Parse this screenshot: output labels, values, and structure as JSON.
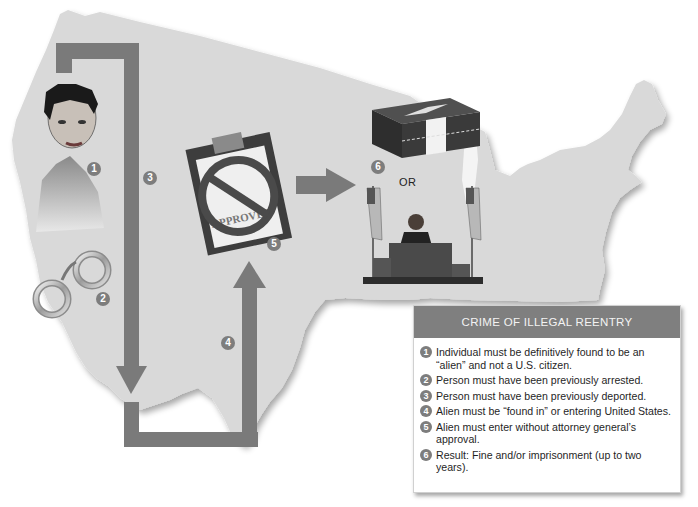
{
  "diagram": {
    "title": "CRIME OF ILLEGAL REENTRY",
    "or_label": "OR",
    "stamp_text": "APPROVED",
    "colors": {
      "map_fill": "#d9d9d9",
      "arrow": "#7a7a7a",
      "marker": "#7d7d7d",
      "legend_header": "#7f7f7f",
      "legend_header_text": "#f3f3f3"
    },
    "markers": [
      {
        "number": "1",
        "label": "person"
      },
      {
        "number": "2",
        "label": "handcuffs"
      },
      {
        "number": "3",
        "label": "deportation-arrow"
      },
      {
        "number": "4",
        "label": "reentry-arrow"
      },
      {
        "number": "5",
        "label": "denied-approval"
      },
      {
        "number": "6",
        "label": "penalty"
      }
    ],
    "legend_items": [
      {
        "number": "1",
        "text": "Individual must be definitively found to be an “alien” and not a U.S. citizen."
      },
      {
        "number": "2",
        "text": "Person must have been previously arrested."
      },
      {
        "number": "3",
        "text": "Person must have been previously deported."
      },
      {
        "number": "4",
        "text": "Alien must be “found in” or entering United States."
      },
      {
        "number": "5",
        "text": "Alien must enter without attorney general’s approval."
      },
      {
        "number": "6",
        "text": "Result: Fine and/or imprisonment (up to two years)."
      }
    ]
  }
}
